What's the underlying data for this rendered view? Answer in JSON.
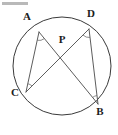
{
  "figure": {
    "type": "circle-geometry-diagram",
    "background_color": "#ffffff",
    "stroke_color": "#3a3a3a",
    "chord_color": "#4a4a4a",
    "arc_color": "#6f6f6f",
    "label_color": "#1c1c1c",
    "circle": {
      "center_x": 62,
      "center_y": 66,
      "radius": 49
    },
    "points": [
      {
        "id": "A",
        "label": "A",
        "x": 39,
        "y": 32,
        "label_x": 27,
        "label_y": 17,
        "has_angle_mark": true
      },
      {
        "id": "D",
        "label": "D",
        "x": 89,
        "y": 29,
        "label_x": 91,
        "label_y": 14,
        "has_angle_mark": true
      },
      {
        "id": "C",
        "label": "C",
        "x": 26,
        "y": 92,
        "label_x": 15,
        "label_y": 93,
        "has_angle_mark": true
      },
      {
        "id": "B",
        "label": "B",
        "x": 98,
        "y": 104,
        "label_x": 100,
        "label_y": 112,
        "has_angle_mark": true
      },
      {
        "id": "P",
        "label": "P",
        "x": 66,
        "y": 49,
        "label_x": 62,
        "label_y": 40,
        "has_angle_mark": false
      }
    ],
    "chords": [
      {
        "id": "AB",
        "from": "A",
        "to": "B"
      },
      {
        "id": "CD",
        "from": "C",
        "to": "D"
      }
    ],
    "intersection": {
      "id": "P",
      "of": [
        "AB",
        "CD"
      ]
    },
    "angle_marks": [
      {
        "at": "A",
        "vertex_x": 39,
        "vertex_y": 32,
        "toward": [
          "C",
          "B"
        ]
      },
      {
        "at": "D",
        "vertex_x": 89,
        "vertex_y": 29,
        "toward": [
          "B",
          "C"
        ]
      },
      {
        "at": "C",
        "vertex_x": 26,
        "vertex_y": 92,
        "toward": [
          "A",
          "D"
        ]
      },
      {
        "at": "B",
        "vertex_x": 98,
        "vertex_y": 104,
        "toward": [
          "D",
          "A"
        ]
      }
    ],
    "artifact_bar": {
      "present": true,
      "color": "#b9b9b9",
      "x": 2,
      "y": 2,
      "width": 26,
      "height": 3
    }
  }
}
